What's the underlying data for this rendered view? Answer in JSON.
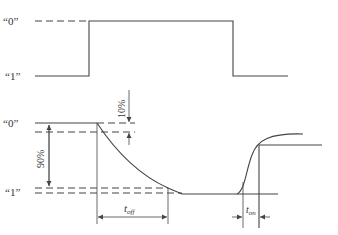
{
  "diagram": {
    "type": "switching-time waveform",
    "input_waveform": {
      "level_high_label": "“0”",
      "level_low_label": "“1”"
    },
    "output_waveform": {
      "level_high_label": "“0”",
      "level_low_label": "“1”",
      "percent_small": "10%",
      "percent_large": "90%",
      "t_off": {
        "symbol": "t",
        "subscript": "off"
      },
      "t_on": {
        "symbol": "t",
        "subscript": "on"
      }
    },
    "colors": {
      "line": "#444444",
      "text": "#333333",
      "background": "#ffffff"
    }
  }
}
